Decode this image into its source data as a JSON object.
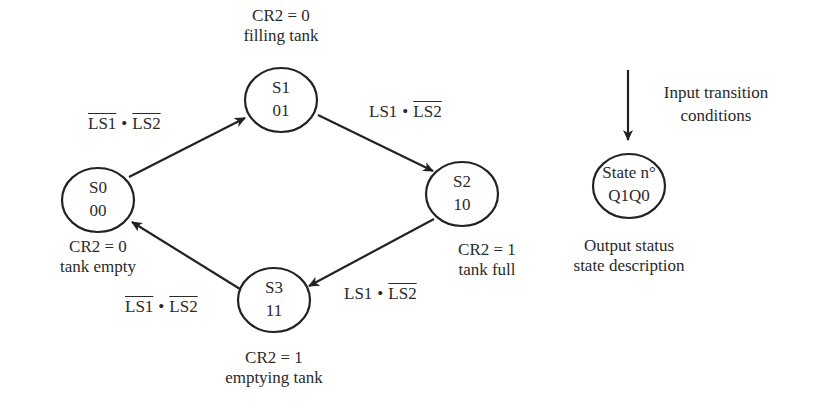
{
  "diagram": {
    "type": "state-machine",
    "states": [
      {
        "id": "S0",
        "name": "S0",
        "code": "00",
        "output": "CR2 = 0",
        "description": "tank empty"
      },
      {
        "id": "S1",
        "name": "S1",
        "code": "01",
        "output": "CR2 = 0",
        "description": "filling tank"
      },
      {
        "id": "S2",
        "name": "S2",
        "code": "10",
        "output": "CR2 = 1",
        "description": "tank full"
      },
      {
        "id": "S3",
        "name": "S3",
        "code": "11",
        "output": "CR2 = 1",
        "description": "emptying tank"
      }
    ],
    "transitions": [
      {
        "from": "S0",
        "to": "S1",
        "a": "LS1",
        "a_negated": true,
        "op": "•",
        "b": "LS2",
        "b_negated": true
      },
      {
        "from": "S1",
        "to": "S2",
        "a": "LS1",
        "a_negated": false,
        "op": "•",
        "b": "LS2",
        "b_negated": true
      },
      {
        "from": "S2",
        "to": "S3",
        "a": "LS1",
        "a_negated": false,
        "op": "•",
        "b": "LS2",
        "b_negated": true
      },
      {
        "from": "S3",
        "to": "S0",
        "a": "LS1",
        "a_negated": true,
        "op": "•",
        "b": "LS2",
        "b_negated": true
      }
    ],
    "legend": {
      "input_label_line1": "Input transition",
      "input_label_line2": "conditions",
      "state_line1": "State n°",
      "state_line2": "Q1Q0",
      "output_line1": "Output status",
      "output_line2": "state description"
    }
  }
}
